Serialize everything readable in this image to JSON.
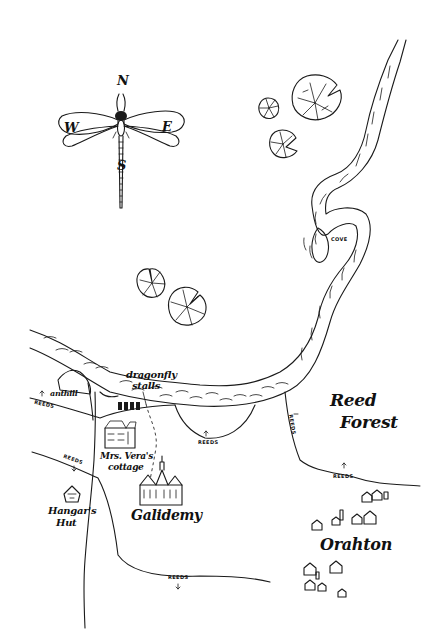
{
  "map": {
    "title": "Hand-drawn fantasy map",
    "ink_color": "#1a1a1a",
    "background": "#ffffff",
    "compass": {
      "north": "N",
      "south": "S",
      "east": "E",
      "west": "W",
      "style": "dragonfly"
    },
    "labels": {
      "dragonfly_stalls": {
        "line1": "dragonfly",
        "line2": "stalls"
      },
      "ant_hill": "anthill",
      "mrs_veras_cottage": {
        "line1": "Mrs. Vera's",
        "line2": "cottage"
      },
      "galidemy": "Galidemy",
      "hangars_hut": {
        "line1": "Hangar's",
        "line2": "Hut"
      },
      "reed_forest": {
        "line1": "Reed",
        "line2": "Forest"
      },
      "orahton": "Orahton",
      "cove": "COVE",
      "reeds": "REEDS"
    },
    "reeds_markers_count": 6,
    "lily_pads_count": 5
  }
}
